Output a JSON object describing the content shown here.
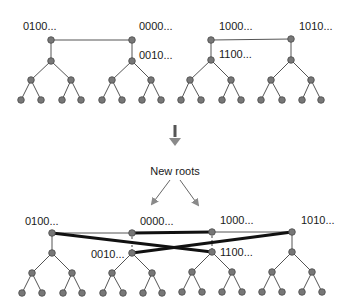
{
  "colors": {
    "node_fill": "#777777",
    "edge": "#555555",
    "thick_edge": "#111111",
    "arrow": "#888888",
    "background": "#ffffff"
  },
  "top": {
    "labels": {
      "a": "0100...",
      "b": "0000...",
      "c": "0010...",
      "d": "1000...",
      "e": "1100...",
      "f": "1010..."
    }
  },
  "middle": {
    "arrow_icon": "down-arrow",
    "caption": "New roots"
  },
  "bottom": {
    "labels": {
      "a": "0100...",
      "b": "0000...",
      "c": "0010...",
      "d": "1000...",
      "e": "1100...",
      "f": "1010..."
    }
  }
}
